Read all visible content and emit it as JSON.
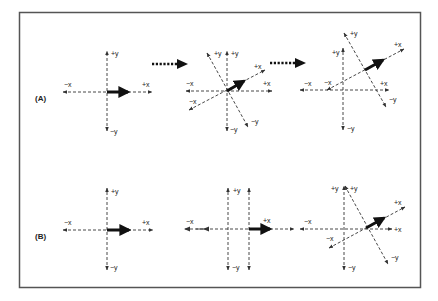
{
  "figure": {
    "frame_color": "#555555",
    "axis_color": "#333333",
    "vector_color": "#111111",
    "rows": [
      {
        "label": "(A)",
        "panels": [
          {
            "name": "original-frame",
            "labels": {
              "px": "+x",
              "nx": "−x",
              "py": "+y",
              "ny": "−y"
            }
          },
          {
            "name": "rotated-frame-overlay",
            "labels": {
              "px": "+x",
              "nx": "−x",
              "py": "+y",
              "ny": "−y",
              "rpx": "+x",
              "rnx": "−x",
              "rpy": "+y",
              "rny": "−y"
            }
          },
          {
            "name": "rotated-translated-frame",
            "labels": {
              "px": "+x",
              "nx": "−x",
              "py": "+y",
              "ny": "−y",
              "rpx": "+x",
              "rnx": "−x",
              "rpy": "+y",
              "rny": "−y"
            }
          }
        ]
      },
      {
        "label": "(B)",
        "panels": [
          {
            "name": "original-frame",
            "labels": {
              "px": "+x",
              "nx": "−x",
              "py": "+y",
              "ny": "−y"
            }
          },
          {
            "name": "translated-frame",
            "labels": {
              "px": "+x",
              "nx": "−x",
              "py": "+y",
              "ny": "−y"
            }
          },
          {
            "name": "translated-rotated-frame",
            "labels": {
              "px": "+x",
              "nx": "−x",
              "py": "+y",
              "ny": "−y",
              "rpx": "+x",
              "rnx": "−x",
              "rpy": "+y",
              "rny": "−y"
            }
          }
        ]
      }
    ]
  }
}
